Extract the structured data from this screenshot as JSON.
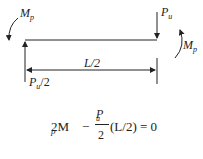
{
  "diagram": {
    "labels": {
      "left_moment": {
        "main": "M",
        "sub": "p"
      },
      "right_moment": {
        "main": "M",
        "sub": "p"
      },
      "load": {
        "main": "P",
        "sub": "u"
      },
      "reaction": {
        "main": "P",
        "sub": "u",
        "suffix": "/2"
      },
      "span": "L/2"
    },
    "equation": {
      "lead": "2M",
      "lead_sub": "p",
      "minus": "−",
      "frac_num_main": "P",
      "frac_num_sub": "u",
      "frac_den": "2",
      "tail": "(L/2) = 0"
    }
  }
}
